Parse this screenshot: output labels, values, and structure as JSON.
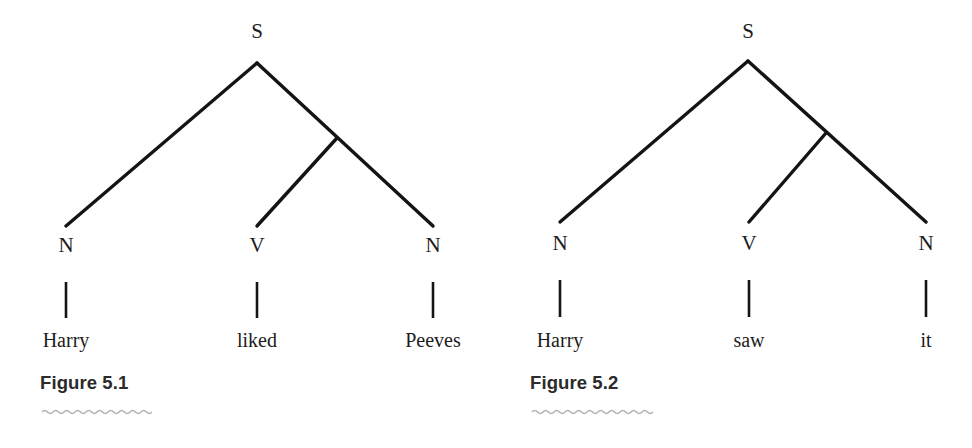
{
  "page": {
    "background_color": "#ffffff",
    "ink_color": "#141414",
    "squiggle_color": "#b3b3b3"
  },
  "figures": [
    {
      "id": "figure-1",
      "caption": "Figure 5.1",
      "root": {
        "label": "S",
        "x": 257,
        "y": 38,
        "apex_x": 257,
        "apex_y": 63
      },
      "junction": {
        "x": 337,
        "y": 138
      },
      "nodes": [
        {
          "label": "N",
          "x": 66,
          "y": 252,
          "branch_end_x": 66,
          "branch_end_y": 226,
          "stem_top": 282,
          "stem_bottom": 318,
          "word": "Harry",
          "word_x": 66,
          "word_y": 347
        },
        {
          "label": "V",
          "x": 257,
          "y": 252,
          "branch_end_x": 257,
          "branch_end_y": 226,
          "stem_top": 282,
          "stem_bottom": 318,
          "word": "liked",
          "word_x": 257,
          "word_y": 347
        },
        {
          "label": "N",
          "x": 433,
          "y": 252,
          "branch_end_x": 433,
          "branch_end_y": 226,
          "stem_top": 282,
          "stem_bottom": 318,
          "word": "Peeves",
          "word_x": 433,
          "word_y": 347
        }
      ],
      "squiggle": {
        "x_start": 42,
        "x_end": 151,
        "y": 412
      }
    },
    {
      "id": "figure-2",
      "caption": "Figure 5.2",
      "root": {
        "label": "S",
        "x": 262,
        "y": 38,
        "apex_x": 262,
        "apex_y": 61
      },
      "junction": {
        "x": 340,
        "y": 133
      },
      "nodes": [
        {
          "label": "N",
          "x": 74,
          "y": 250,
          "branch_end_x": 74,
          "branch_end_y": 222,
          "stem_top": 280,
          "stem_bottom": 317,
          "word": "Harry",
          "word_x": 74,
          "word_y": 347
        },
        {
          "label": "V",
          "x": 263,
          "y": 250,
          "branch_end_x": 263,
          "branch_end_y": 222,
          "stem_top": 280,
          "stem_bottom": 317,
          "word": "saw",
          "word_x": 263,
          "word_y": 347
        },
        {
          "label": "N",
          "x": 440,
          "y": 250,
          "branch_end_x": 440,
          "branch_end_y": 222,
          "stem_top": 280,
          "stem_bottom": 317,
          "word": "it",
          "word_x": 440,
          "word_y": 347
        }
      ],
      "squiggle": {
        "x_start": 46,
        "x_end": 160,
        "y": 412
      }
    }
  ]
}
